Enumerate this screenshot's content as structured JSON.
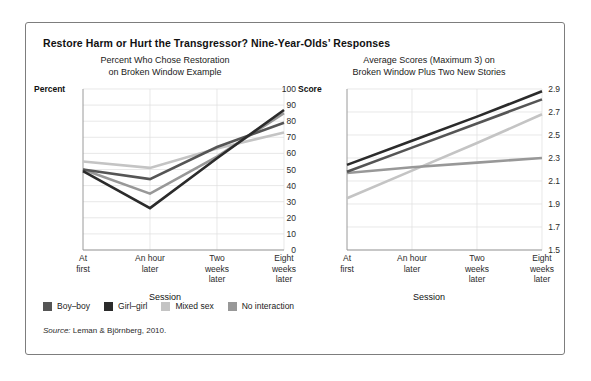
{
  "figure": {
    "title": "Restore Harm or Hurt the Transgressor? Nine-Year-Olds’ Responses",
    "source_word": "Source:",
    "source_text": " Leman & Björnberg, 2010."
  },
  "legend": {
    "items": [
      {
        "label": "Boy–boy",
        "color": "#555555"
      },
      {
        "label": "Girl–girl",
        "color": "#2b2b2b"
      },
      {
        "label": "Mixed sex",
        "color": "#c4c4c4"
      },
      {
        "label": "No interaction",
        "color": "#989898"
      }
    ]
  },
  "chart_data": [
    {
      "id": "left",
      "type": "line",
      "title": "Percent Who Chose Restoration\non Broken Window Example",
      "title_line1": "Percent Who Chose Restoration",
      "title_line2": "on Broken Window Example",
      "xlabel": "Session",
      "ylabel": "Percent",
      "ylim": [
        0,
        100
      ],
      "yticks": [
        0,
        10,
        20,
        30,
        40,
        50,
        60,
        70,
        80,
        90,
        100
      ],
      "ytick_labels": [
        "0",
        "10",
        "20",
        "30",
        "40",
        "50",
        "60",
        "70",
        "80",
        "90",
        "100"
      ],
      "categories": [
        "At\nfirst",
        "An hour\nlater",
        "Two\nweeks\nlater",
        "Eight\nweeks\nlater"
      ],
      "grid": true,
      "legend_position": "below-figure",
      "series": [
        {
          "name": "Boy–boy",
          "color": "#555555",
          "values": [
            50,
            44,
            64,
            79
          ]
        },
        {
          "name": "Girl–girl",
          "color": "#2b2b2b",
          "values": [
            49,
            26,
            57,
            87
          ]
        },
        {
          "name": "Mixed sex",
          "color": "#c4c4c4",
          "values": [
            55,
            51,
            63,
            73
          ]
        },
        {
          "name": "No interaction",
          "color": "#989898",
          "values": [
            50,
            35,
            58,
            85
          ]
        }
      ]
    },
    {
      "id": "right",
      "type": "line",
      "title": "Average Scores (Maximum 3) on\nBroken Window Plus Two New Stories",
      "title_line1": "Average Scores (Maximum 3) on",
      "title_line2": "Broken Window Plus Two New Stories",
      "xlabel": "Session",
      "ylabel": "Score",
      "ylim": [
        1.5,
        2.9
      ],
      "yticks": [
        1.5,
        1.7,
        1.9,
        2.1,
        2.3,
        2.5,
        2.7,
        2.9
      ],
      "ytick_labels": [
        "1.5",
        "1.7",
        "1.9",
        "2.1",
        "2.3",
        "2.5",
        "2.7",
        "2.9"
      ],
      "categories": [
        "At\nfirst",
        "An hour\nlater",
        "Two\nweeks\nlater",
        "Eight\nweeks\nlater"
      ],
      "grid": true,
      "legend_position": "below-figure",
      "series": [
        {
          "name": "Boy–boy",
          "color": "#555555",
          "values": [
            2.18,
            2.39,
            2.6,
            2.81
          ]
        },
        {
          "name": "Girl–girl",
          "color": "#2b2b2b",
          "values": [
            2.24,
            2.45,
            2.66,
            2.88
          ]
        },
        {
          "name": "Mixed sex",
          "color": "#c4c4c4",
          "values": [
            1.95,
            2.19,
            2.43,
            2.68
          ]
        },
        {
          "name": "No interaction",
          "color": "#989898",
          "values": [
            2.17,
            2.22,
            2.26,
            2.3
          ]
        }
      ]
    }
  ]
}
